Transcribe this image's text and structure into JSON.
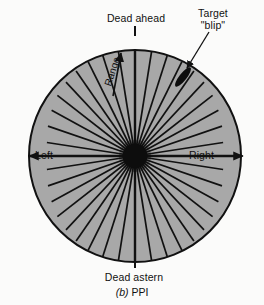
{
  "figure": {
    "caption_letter": "(b)",
    "caption_text": "PPI",
    "type": "radar-ppi-display-diagram",
    "background_color": "#fbfbfa"
  },
  "display": {
    "name": "plan-position-indicator",
    "disc_fill_color": "#a8a8a8",
    "outline_color": "#111111",
    "hub_color": "#0d0d0d",
    "center_x": 135,
    "center_y": 156,
    "radius": 106,
    "hub_radius": 12,
    "spoke_count": 40,
    "spoke_spacing_degrees": 9
  },
  "labels": {
    "dead_ahead": "Dead ahead",
    "dead_astern": "Dead astern",
    "left": "Left",
    "right": "Right",
    "range": "Range",
    "target_line1": "Target",
    "target_line2": "\"blip\""
  },
  "annotations": {
    "range_arrow": {
      "name": "range-direction-arrow",
      "direction": "outward-from-center",
      "angle_degrees": 18
    },
    "target_blip": {
      "name": "target-blip-marker",
      "shape": "ellipse",
      "fill_color": "#0d0d0d",
      "x": 183,
      "y": 77,
      "rotation_degrees": -52,
      "length": 24,
      "width": 7
    },
    "left_arrow": {
      "name": "left-bearing-arrow",
      "points": "left"
    },
    "right_arrow": {
      "name": "right-bearing-arrow",
      "points": "right"
    },
    "target_leader_line": {
      "name": "target-leader-line",
      "from_x": 208,
      "from_y": 33,
      "to_x": 186,
      "to_y": 68
    }
  }
}
